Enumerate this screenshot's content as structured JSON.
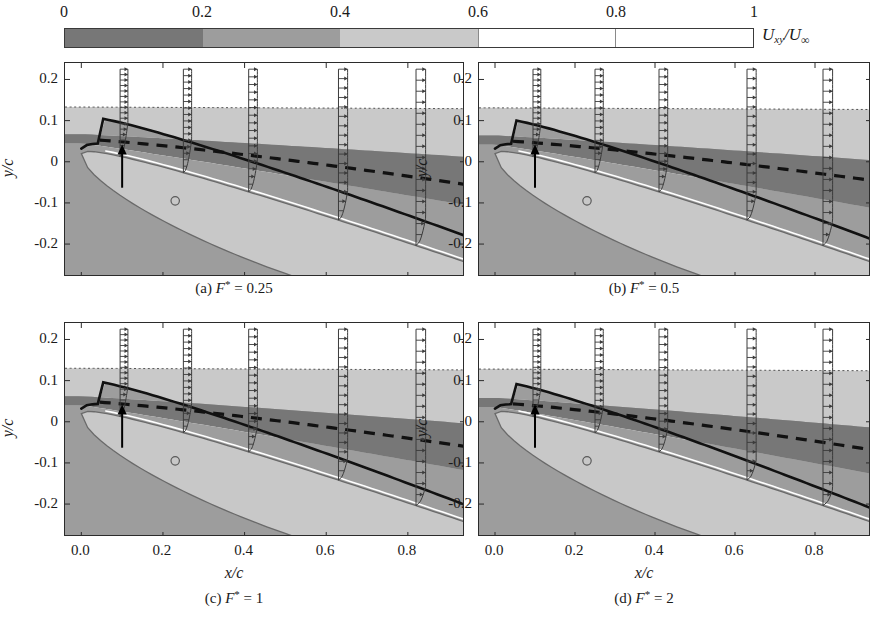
{
  "figure": {
    "type": "contour-plot-grid",
    "rows": 2,
    "cols": 2
  },
  "colorbar": {
    "label_main": "U",
    "label_sub": "xy",
    "label_div": "/U",
    "label_inf": "∞",
    "min": 0,
    "max": 1,
    "ticks": [
      "0",
      "0.2",
      "0.4",
      "0.6",
      "0.8",
      "1"
    ],
    "tick_values": [
      0,
      0.2,
      0.4,
      0.6,
      0.8,
      1
    ],
    "bands": [
      {
        "from": 0.0,
        "to": 0.2,
        "color": "#777777"
      },
      {
        "from": 0.2,
        "to": 0.4,
        "color": "#9d9d9d"
      },
      {
        "from": 0.4,
        "to": 0.6,
        "color": "#c9c9c9"
      },
      {
        "from": 0.6,
        "to": 1.0,
        "color": "#ffffff"
      }
    ]
  },
  "axes": {
    "xlabel": "x/c",
    "ylabel": "y/c",
    "xticks": [
      "0.0",
      "0.2",
      "0.4",
      "0.6",
      "0.8"
    ],
    "xtick_values": [
      0.0,
      0.2,
      0.4,
      0.6,
      0.8
    ],
    "yticks": [
      "0.2",
      "0.1",
      "0",
      "-0.1",
      "-0.2"
    ],
    "ytick_values": [
      0.2,
      0.1,
      0,
      -0.1,
      -0.2
    ],
    "xlim": [
      -0.04,
      0.94
    ],
    "ylim": [
      -0.28,
      0.24
    ]
  },
  "panels": [
    {
      "id": "a",
      "caption_prefix": "(a) ",
      "caption_var": "F",
      "caption_star": "*",
      "caption_value": " = 0.25",
      "F_star": 0.25,
      "bl_edge_peak": 0.072,
      "bl_edge_te": 0.052,
      "shear_peak": 0.055,
      "shear_te": -0.055,
      "dotted_level": 0.133,
      "band_mid_te": 0.012,
      "band_low_te": -0.105
    },
    {
      "id": "b",
      "caption_prefix": "(b) ",
      "caption_var": "F",
      "caption_star": "*",
      "caption_value": " = 0.5",
      "F_star": 0.5,
      "bl_edge_peak": 0.068,
      "bl_edge_te": 0.044,
      "shear_peak": 0.052,
      "shear_te": -0.045,
      "dotted_level": 0.131,
      "band_mid_te": 0.004,
      "band_low_te": -0.112
    },
    {
      "id": "c",
      "caption_prefix": "(c) ",
      "caption_var": "F",
      "caption_star": "*",
      "caption_value": " = 1",
      "F_star": 1,
      "bl_edge_peak": 0.064,
      "bl_edge_te": 0.03,
      "shear_peak": 0.05,
      "shear_te": -0.06,
      "dotted_level": 0.13,
      "band_mid_te": -0.004,
      "band_low_te": -0.118
    },
    {
      "id": "d",
      "caption_prefix": "(d) ",
      "caption_var": "F",
      "caption_star": "*",
      "caption_value": " = 2",
      "F_star": 2,
      "bl_edge_peak": 0.06,
      "bl_edge_te": 0.022,
      "shear_peak": 0.046,
      "shear_te": -0.068,
      "dotted_level": 0.128,
      "band_mid_te": -0.014,
      "band_low_te": -0.126
    }
  ],
  "annotations": {
    "arrow_x": 0.1,
    "arrow_label": "actuator-location-arrow",
    "circle_marker_x": 0.23,
    "circle_marker_y": -0.095,
    "profile_stations": [
      0.095,
      0.25,
      0.41,
      0.63,
      0.82
    ]
  },
  "airfoil": {
    "chord": 1.0,
    "leading_edge": [
      0.0,
      0.02
    ],
    "trailing_edge": [
      0.94,
      -0.3
    ],
    "fill_color": "#c8c8c8",
    "edge_color": "#6a6a6a"
  },
  "styles": {
    "bl_edge_line": "solid-thick-black",
    "shear_line": "dashed-thick-black",
    "outer_line": "dotted-thin-gray",
    "profile_line": "thin-dark-gray"
  }
}
